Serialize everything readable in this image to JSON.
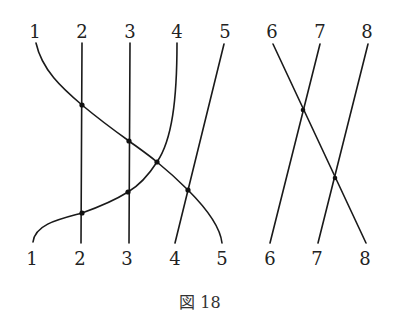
{
  "figure": {
    "caption": "図 18",
    "top_labels": [
      "1",
      "2",
      "3",
      "4",
      "5",
      "6",
      "7",
      "8"
    ],
    "bottom_labels": [
      "1",
      "2",
      "3",
      "4",
      "5",
      "6",
      "7",
      "8"
    ],
    "ink_color": "#1a1a1a",
    "background": "#ffffff"
  },
  "diagram": {
    "type": "amidakuji-style permutation / strand diagram",
    "group_left": {
      "strands": [
        {
          "from_top": "1",
          "to_bottom": "5",
          "shape": "curve"
        },
        {
          "from_top": "2",
          "to_bottom": "2",
          "shape": "straight vertical"
        },
        {
          "from_top": "3",
          "to_bottom": "3",
          "shape": "straight vertical"
        },
        {
          "from_top": "4",
          "to_bottom": "1",
          "shape": "curve"
        },
        {
          "from_top": "5",
          "to_bottom": "4",
          "shape": "straight diagonal"
        }
      ],
      "crossings": 6
    },
    "group_right": {
      "strands": [
        {
          "from_top": "6",
          "to_bottom": "8",
          "shape": "straight diagonal"
        },
        {
          "from_top": "7",
          "to_bottom": "6",
          "shape": "straight diagonal"
        },
        {
          "from_top": "8",
          "to_bottom": "7",
          "shape": "straight diagonal"
        }
      ],
      "crossings": 2
    }
  }
}
